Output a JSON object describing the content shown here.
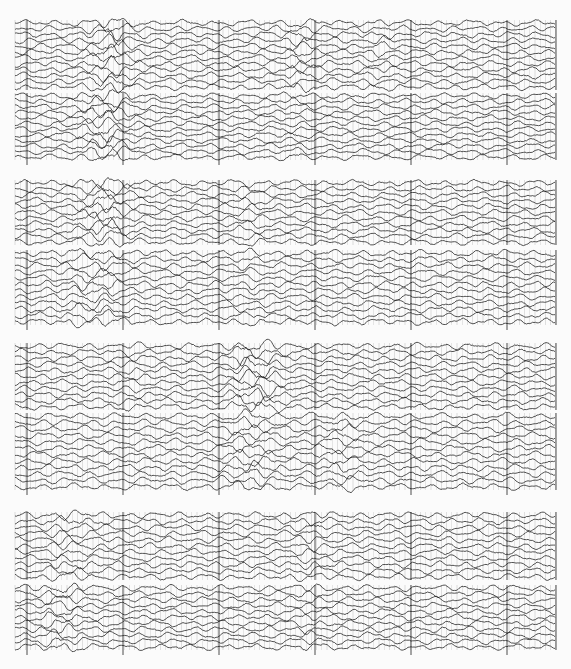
{
  "figure": {
    "width": 571,
    "height": 669,
    "background": "#fbfbfb",
    "ink_color": "#1a1a1a",
    "grid_color": "#555555",
    "x_start": 15,
    "x_end": 556,
    "timing_line_spacing": 5.2,
    "major_tick_spacing": 96,
    "major_tick_offset": 12
  },
  "panels": [
    {
      "name": "record-1",
      "bands": [
        {
          "y0": 20,
          "y1": 90,
          "traces": 12,
          "bursts": [
            {
              "x": 110,
              "w": 22,
              "amp": 2.4
            },
            {
              "x": 300,
              "w": 18,
              "amp": 1.8
            },
            {
              "x": 380,
              "w": 14,
              "amp": 1.5
            }
          ]
        },
        {
          "y0": 93,
          "y1": 160,
          "traces": 12,
          "bursts": [
            {
              "x": 105,
              "w": 25,
              "amp": 2.6
            },
            {
              "x": 295,
              "w": 16,
              "amp": 1.5
            }
          ]
        }
      ]
    },
    {
      "name": "record-2",
      "bands": [
        {
          "y0": 180,
          "y1": 245,
          "traces": 11,
          "bursts": [
            {
              "x": 105,
              "w": 24,
              "amp": 2.5
            },
            {
              "x": 250,
              "w": 18,
              "amp": 1.5
            }
          ]
        },
        {
          "y0": 250,
          "y1": 325,
          "traces": 12,
          "bursts": [
            {
              "x": 95,
              "w": 30,
              "amp": 1.9
            },
            {
              "x": 250,
              "w": 16,
              "amp": 1.4
            }
          ]
        }
      ]
    },
    {
      "name": "record-3",
      "bands": [
        {
          "y0": 343,
          "y1": 410,
          "traces": 11,
          "bursts": [
            {
              "x": 255,
              "w": 22,
              "amp": 2.6
            },
            {
              "x": 130,
              "w": 14,
              "amp": 1.4
            }
          ]
        },
        {
          "y0": 413,
          "y1": 490,
          "traces": 12,
          "bursts": [
            {
              "x": 250,
              "w": 26,
              "amp": 1.9
            },
            {
              "x": 340,
              "w": 20,
              "amp": 1.6
            }
          ]
        }
      ]
    },
    {
      "name": "record-4",
      "bands": [
        {
          "y0": 512,
          "y1": 580,
          "traces": 11,
          "bursts": [
            {
              "x": 70,
              "w": 20,
              "amp": 1.8
            },
            {
              "x": 310,
              "w": 18,
              "amp": 1.6
            }
          ]
        },
        {
          "y0": 585,
          "y1": 650,
          "traces": 11,
          "bursts": [
            {
              "x": 60,
              "w": 24,
              "amp": 1.9
            },
            {
              "x": 310,
              "w": 16,
              "amp": 1.5
            }
          ]
        }
      ]
    }
  ]
}
